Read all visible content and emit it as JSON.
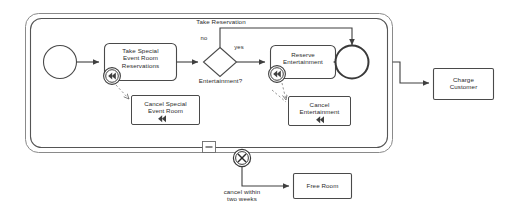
{
  "diagram": {
    "type": "bpmn-transaction-subprocess",
    "title_label": "Take Reservation",
    "colors": {
      "stroke": "#3f3f3f",
      "stroke_light": "#6e6e6e",
      "text": "#2b2b2b",
      "background": "#ffffff"
    },
    "subprocess": {
      "name": "transaction-subprocess",
      "collapse_marker": "minus",
      "border_style": "double"
    },
    "events": [
      {
        "id": "start",
        "kind": "start-event",
        "label": ""
      },
      {
        "id": "end",
        "kind": "end-event",
        "label": ""
      },
      {
        "id": "cancel",
        "kind": "cancel-boundary-event",
        "marker": "X",
        "label": ""
      }
    ],
    "gateway": {
      "id": "entertainment-gateway",
      "kind": "exclusive-gateway",
      "label": "Entertainment?",
      "branches": [
        {
          "id": "no",
          "label": "no"
        },
        {
          "id": "yes",
          "label": "yes"
        }
      ]
    },
    "tasks": [
      {
        "id": "take-special-event-room-reservations",
        "label": "Take Special\nEvent Room\nReservations",
        "marker": "compensation",
        "marker_attached": true
      },
      {
        "id": "reserve-entertainment",
        "label": "Reserve\nEntertainment",
        "marker": "compensation",
        "marker_attached": true
      },
      {
        "id": "cancel-special-event-room",
        "label": "Cancel Special\nEvent Room",
        "marker": "compensation",
        "marker_attached": false
      },
      {
        "id": "cancel-entertainment",
        "label": "Cancel\nEntertainment",
        "marker": "compensation",
        "marker_attached": false
      },
      {
        "id": "charge-customer",
        "label": "Charge\nCustomer",
        "marker": "none",
        "marker_attached": false
      },
      {
        "id": "free-room",
        "label": "Free Room",
        "marker": "none",
        "marker_attached": false
      }
    ],
    "flow_labels": [
      {
        "id": "take-reservation-loop",
        "label": "Take Reservation"
      },
      {
        "id": "cancel-within-two-weeks",
        "label": "cancel within\ntwo weeks"
      }
    ]
  }
}
